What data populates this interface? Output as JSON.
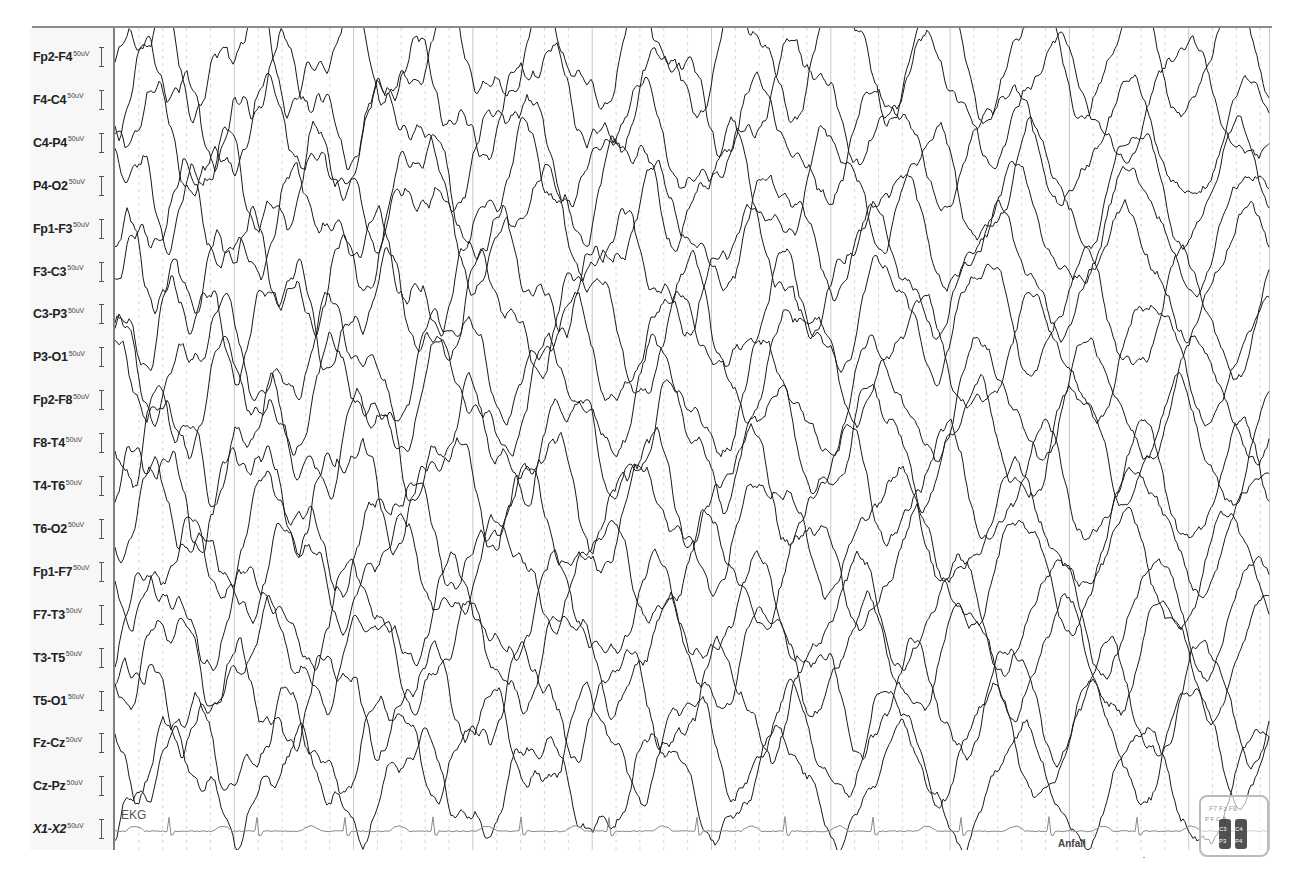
{
  "viewer": {
    "type": "EEG recording viewer",
    "sensitivity_unit": "50uV",
    "channels": [
      {
        "name": "Fp2-F4",
        "scale": "50uV",
        "type": "eeg"
      },
      {
        "name": "F4-C4",
        "scale": "50uV",
        "type": "eeg"
      },
      {
        "name": "C4-P4",
        "scale": "50uV",
        "type": "eeg"
      },
      {
        "name": "P4-O2",
        "scale": "50uV",
        "type": "eeg"
      },
      {
        "name": "Fp1-F3",
        "scale": "50uV",
        "type": "eeg"
      },
      {
        "name": "F3-C3",
        "scale": "50uV",
        "type": "eeg"
      },
      {
        "name": "C3-P3",
        "scale": "50uV",
        "type": "eeg"
      },
      {
        "name": "P3-O1",
        "scale": "50uV",
        "type": "eeg"
      },
      {
        "name": "Fp2-F8",
        "scale": "50uV",
        "type": "eeg"
      },
      {
        "name": "F8-T4",
        "scale": "50uV",
        "type": "eeg"
      },
      {
        "name": "T4-T6",
        "scale": "50uV",
        "type": "eeg"
      },
      {
        "name": "T6-O2",
        "scale": "50uV",
        "type": "eeg"
      },
      {
        "name": "Fp1-F7",
        "scale": "50uV",
        "type": "eeg"
      },
      {
        "name": "F7-T3",
        "scale": "50uV",
        "type": "eeg"
      },
      {
        "name": "T3-T5",
        "scale": "50uV",
        "type": "eeg"
      },
      {
        "name": "T5-O1",
        "scale": "50uV",
        "type": "eeg"
      },
      {
        "name": "Fz-Cz",
        "scale": "50uV",
        "type": "eeg"
      },
      {
        "name": "Cz-Pz",
        "scale": "50uV",
        "type": "eeg"
      },
      {
        "name": "X1-X2",
        "scale": "50uV",
        "type": "ekg"
      }
    ],
    "ekg_trace_label": "EKG",
    "event_marker_label": "Anfall",
    "grid": {
      "major_interval_px": 119.3,
      "minor_per_major": 5,
      "major_color": "#c8c8c8",
      "minor_color": "#d6d6d6"
    },
    "colors": {
      "eeg_trace": "#1a1a1a",
      "ekg_trace": "#8a8a8a",
      "label_panel_bg": "#f7f7f7"
    },
    "montage_map_icon": "head-electrode-map-icon"
  }
}
